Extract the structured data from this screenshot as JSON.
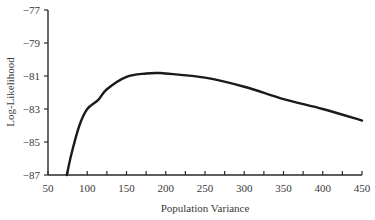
{
  "chart_data": {
    "type": "line",
    "title": "",
    "xlabel": "Population Variance",
    "ylabel": "Log-Likelihood",
    "xlim": [
      50,
      450
    ],
    "ylim": [
      -87,
      -77
    ],
    "x_ticks": [
      50,
      100,
      150,
      200,
      250,
      300,
      350,
      400,
      450
    ],
    "x_minor_tick_step": 25,
    "y_ticks": [
      -87,
      -85,
      -83,
      -81,
      -79,
      -77
    ],
    "y_tick_labels": [
      "−87",
      "−85",
      "−83",
      "−81",
      "−79",
      "−77"
    ],
    "grid": false,
    "legend": null,
    "series": [
      {
        "name": "Log-Likelihood",
        "color": "#1a1a1a",
        "x": [
          74,
          80,
          90,
          100,
          114,
          125,
          150,
          175,
          190,
          200,
          250,
          300,
          350,
          400,
          450
        ],
        "y": [
          -87.0,
          -85.7,
          -84.0,
          -83.0,
          -82.45,
          -81.8,
          -81.05,
          -80.85,
          -80.82,
          -80.85,
          -81.1,
          -81.65,
          -82.4,
          -83.0,
          -83.7
        ]
      }
    ],
    "annotations": []
  }
}
